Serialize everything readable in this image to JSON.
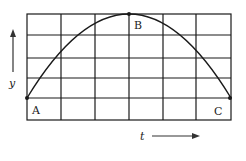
{
  "diagram": {
    "grid": {
      "x_lines": [
        27,
        61,
        95,
        129,
        163,
        196,
        231
      ],
      "y_lines": [
        14,
        35,
        58,
        78,
        98,
        120
      ],
      "columns": 6,
      "rows": 5
    },
    "curve": {
      "shape": "parabola",
      "start": "A",
      "peak": "B",
      "end": "C"
    },
    "points": {
      "A": {
        "label": "A"
      },
      "B": {
        "label": "B"
      },
      "C": {
        "label": "C"
      }
    },
    "axes": {
      "y_label": "y",
      "t_label": "t"
    },
    "colors": {
      "line": "#1a1a1a",
      "background": "#ffffff"
    }
  }
}
